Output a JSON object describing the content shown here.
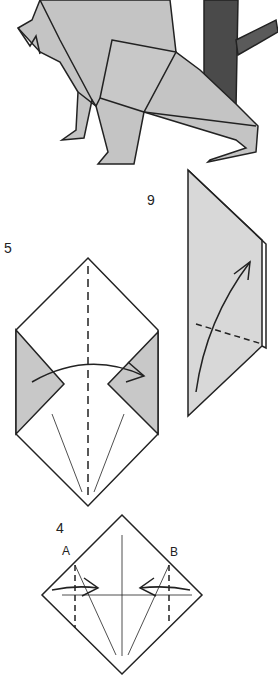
{
  "diagram": {
    "type": "origami-instructions",
    "orientation": "rotated-180",
    "colors": {
      "paper_colored": "#c4c4c4",
      "paper_light": "#d8d8d8",
      "paper_white": "#ffffff",
      "line": "#222222",
      "trunk": "#555555"
    },
    "steps": [
      {
        "number": "6",
        "label_text": "9",
        "description": "Valley fold, flap folded up along dashed line"
      },
      {
        "number": "5",
        "label_text": "5",
        "description": "Valley fold in half along center dashed line"
      },
      {
        "number": "4",
        "label_text": "4",
        "description": "Fold corners A and B to center",
        "points": [
          "A",
          "B"
        ]
      }
    ],
    "final_model": {
      "description": "Completed origami animal beside tree trunk"
    }
  }
}
